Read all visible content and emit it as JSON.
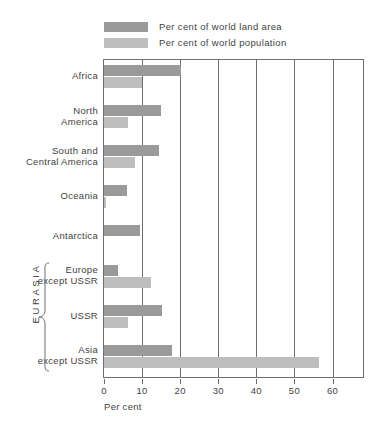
{
  "legend": {
    "items": [
      {
        "label": "Per cent of world land area",
        "key": "land",
        "color": "#9a9a9a"
      },
      {
        "label": "Per cent of world population",
        "key": "pop",
        "color": "#bebebe"
      }
    ]
  },
  "axis": {
    "title": "Per cent",
    "ticks": [
      0,
      10,
      20,
      30,
      40,
      50,
      60
    ],
    "tick_labels": [
      "0",
      "10",
      "20",
      "30",
      "40",
      "50",
      "60"
    ],
    "max": 68
  },
  "group": {
    "eurasia_label": "EURASIA",
    "eurasia_members": [
      "Europe except USSR",
      "USSR",
      "Asia except USSR"
    ]
  },
  "chart_data": {
    "type": "bar",
    "orientation": "horizontal",
    "title": "",
    "xlabel": "Per cent",
    "ylabel": "",
    "xlim": [
      0,
      68
    ],
    "grid": true,
    "legend_position": "top",
    "categories": [
      "Africa",
      "North America",
      "South and Central America",
      "Oceania",
      "Antarctica",
      "Europe except USSR",
      "USSR",
      "Asia except USSR"
    ],
    "category_lines": [
      [
        "Africa"
      ],
      [
        "North",
        "America"
      ],
      [
        "South and",
        "Central America"
      ],
      [
        "Oceania"
      ],
      [
        "Antarctica"
      ],
      [
        "Europe",
        "except USSR"
      ],
      [
        "USSR"
      ],
      [
        "Asia",
        "except USSR"
      ]
    ],
    "series": [
      {
        "name": "Per cent of world land area",
        "color": "#9a9a9a",
        "values": [
          20.2,
          15.0,
          14.4,
          6.0,
          9.4,
          3.6,
          15.1,
          17.8
        ]
      },
      {
        "name": "Per cent of world population",
        "color": "#bebebe",
        "values": [
          10.0,
          6.2,
          8.1,
          0.5,
          0.0,
          12.4,
          6.4,
          56.4
        ]
      }
    ]
  }
}
